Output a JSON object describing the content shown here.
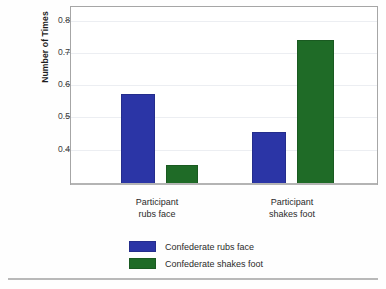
{
  "chart_data": {
    "type": "bar",
    "title": "",
    "xlabel": "",
    "ylabel": "Number of Times per Minute",
    "ylabel_lines": [
      "Number of Times",
      "per Minute"
    ],
    "categories": [
      "Participant rubs face",
      "Participant shakes foot"
    ],
    "category_lines": [
      [
        "Participant",
        "rubs face"
      ],
      [
        "Participant",
        "shakes foot"
      ]
    ],
    "series": [
      {
        "name": "Confederate rubs face",
        "color": "#2b35a6",
        "values": [
          0.57,
          0.45
        ]
      },
      {
        "name": "Confederate shakes foot",
        "color": "#1f6b27",
        "values": [
          0.35,
          0.735
        ]
      }
    ],
    "yticks": [
      0.4,
      0.5,
      0.6,
      0.7,
      0.8
    ],
    "ytick_labels": [
      "0.4",
      "0.5",
      "0.6",
      "0.7",
      "0.8"
    ],
    "ylim": [
      0.29,
      0.845
    ],
    "grid": true,
    "legend_position": "bottom"
  },
  "legend": {
    "items": [
      {
        "label": "Confederate rubs face",
        "color": "#2b35a6"
      },
      {
        "label": "Confederate shakes foot",
        "color": "#1f6b27"
      }
    ]
  }
}
